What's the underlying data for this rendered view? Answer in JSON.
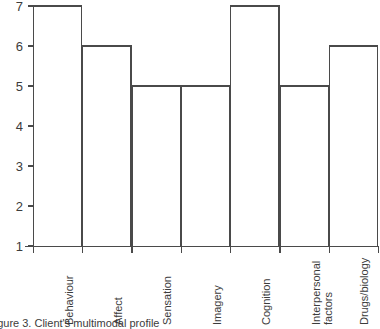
{
  "figure": {
    "caption": "Figure 3.  Client's multimodal profile",
    "line_color": "#4a4a4a",
    "background": "#ffffff"
  },
  "chart_data": {
    "type": "bar",
    "title": "",
    "xlabel": "",
    "ylabel": "",
    "ylim": [
      1,
      7
    ],
    "yticks": [
      1,
      2,
      3,
      4,
      5,
      6,
      7
    ],
    "ytick_labels": [
      "1",
      "2",
      "3",
      "4",
      "5",
      "6",
      "7"
    ],
    "grid": false,
    "legend": null,
    "bar_style": "outline-only",
    "bar_gap": 0,
    "categories": [
      "Behaviour",
      "Affect",
      "Sensation",
      "Imagery",
      "Cognition",
      "Interpersonal factors",
      "Drugs/biology"
    ],
    "category_label_lines": [
      [
        "Behaviour"
      ],
      [
        "Affect"
      ],
      [
        "Sensation"
      ],
      [
        "Imagery"
      ],
      [
        "Cognition"
      ],
      [
        "Interpersonal",
        "factors"
      ],
      [
        "Drugs/biology"
      ]
    ],
    "category_label_rotation": -90,
    "values": [
      7,
      6,
      5,
      5,
      7,
      5,
      6
    ]
  }
}
